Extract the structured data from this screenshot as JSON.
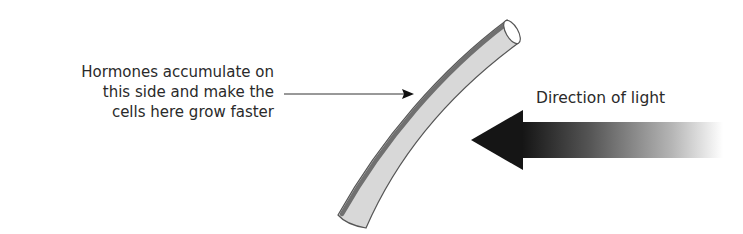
{
  "labels": {
    "hormone_lines": [
      "Hormones accumulate on",
      "this side and make the",
      "cells here grow faster"
    ],
    "light": "Direction of light"
  },
  "colors": {
    "stem_fill": "#d6d6d6",
    "stem_outline": "#555555",
    "hormone_band": "#6e6e6e",
    "arrow_dark": "#1a1a1a",
    "text": "#2a2a2a"
  }
}
